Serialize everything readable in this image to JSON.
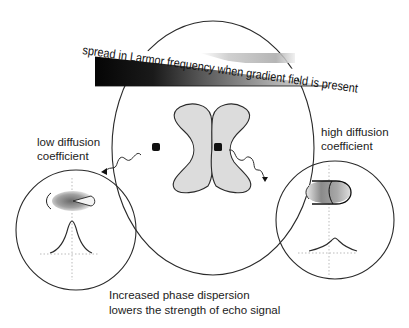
{
  "diagram": {
    "wedge_label": "spread in Larmor frequency when gradient field is present",
    "left_label": {
      "line1": "low diffusion",
      "line2": "coefficient"
    },
    "right_label": {
      "line1": "high diffusion",
      "line2": "coefficient"
    },
    "caption": {
      "line1": "Increased phase dispersion",
      "line2": "lowers the strength of echo signal"
    },
    "colors": {
      "stroke": "#2a2a2a",
      "lobe_fill": "#dcdcdc",
      "wedge_dark": "#0a0a0a",
      "wedge_light": "#f2f2f2"
    }
  }
}
